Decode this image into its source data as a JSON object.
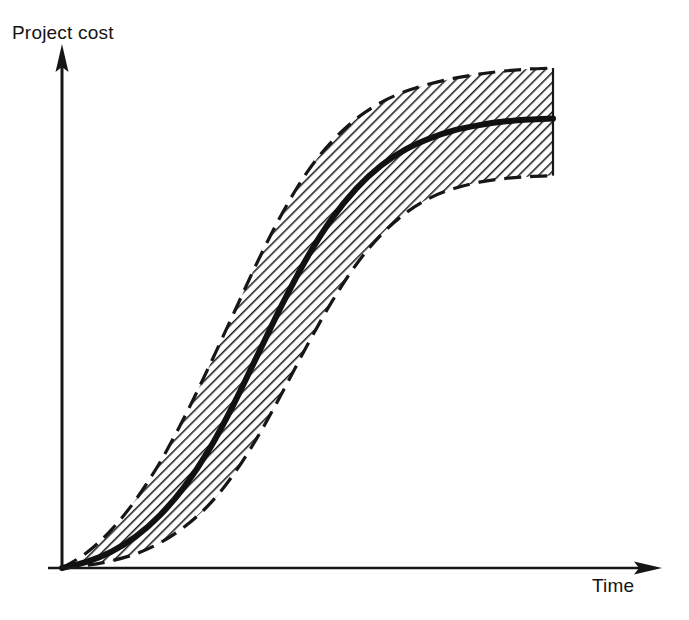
{
  "figure": {
    "title": "",
    "background_color": "#ffffff",
    "ink_color": "#141414"
  },
  "axes": {
    "y": {
      "label": "Project cost",
      "tick_labels": [],
      "arrow": "up"
    },
    "x": {
      "label": "Time",
      "tick_labels": [],
      "arrow": "right"
    }
  },
  "chart_data": {
    "type": "line",
    "title": "",
    "xlabel": "Time",
    "ylabel": "Project cost",
    "xlim": [
      0,
      1
    ],
    "ylim": [
      0,
      1
    ],
    "grid": false,
    "legend": null,
    "axis_ticks": false,
    "annotations": [],
    "x": [
      0.0,
      0.05,
      0.1,
      0.15,
      0.2,
      0.25,
      0.3,
      0.35,
      0.4,
      0.45,
      0.5,
      0.55,
      0.6,
      0.65,
      0.7,
      0.75,
      0.8,
      0.85,
      0.9,
      0.95,
      1.0
    ],
    "series": [
      {
        "name": "Upper bound (pessimistic)",
        "style": "dashed",
        "values": [
          0.0,
          0.03,
          0.075,
          0.135,
          0.21,
          0.3,
          0.4,
          0.505,
          0.61,
          0.705,
          0.785,
          0.845,
          0.89,
          0.922,
          0.944,
          0.959,
          0.97,
          0.978,
          0.984,
          0.988,
          0.99
        ]
      },
      {
        "name": "Expected cost",
        "style": "solid",
        "values": [
          0.0,
          0.012,
          0.032,
          0.062,
          0.105,
          0.162,
          0.235,
          0.325,
          0.425,
          0.525,
          0.616,
          0.692,
          0.752,
          0.797,
          0.829,
          0.851,
          0.867,
          0.877,
          0.884,
          0.888,
          0.89
        ]
      },
      {
        "name": "Lower bound (optimistic)",
        "style": "dashed",
        "values": [
          0.0,
          0.005,
          0.014,
          0.028,
          0.05,
          0.082,
          0.126,
          0.186,
          0.262,
          0.35,
          0.442,
          0.528,
          0.602,
          0.66,
          0.703,
          0.733,
          0.752,
          0.764,
          0.771,
          0.775,
          0.777
        ]
      }
    ],
    "band": {
      "fill": "diagonal-hatch",
      "between": [
        "Lower bound (optimistic)",
        "Upper bound (pessimistic)"
      ]
    }
  }
}
